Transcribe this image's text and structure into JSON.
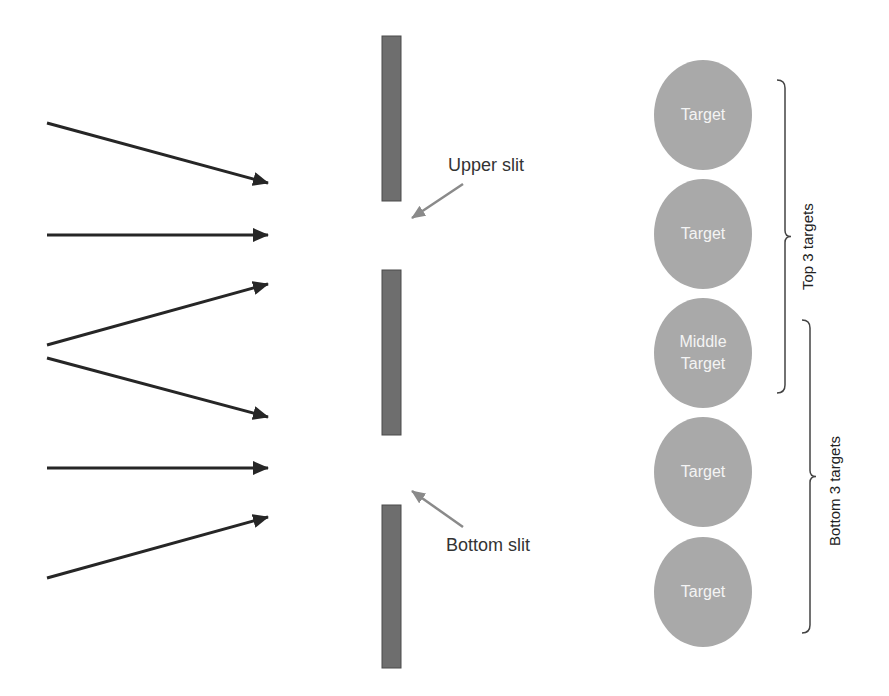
{
  "diagram": {
    "colors": {
      "arrow": "#262626",
      "barrier": "#6e6e6e",
      "pointer": "#8a8a8a",
      "target_fill": "#a9a9a9",
      "target_text": "#f4f4f4",
      "brace": "#444444"
    },
    "incoming_rays": [
      {
        "from": [
          47,
          123
        ],
        "to": [
          268,
          183
        ]
      },
      {
        "from": [
          47,
          235
        ],
        "to": [
          268,
          235
        ]
      },
      {
        "from": [
          47,
          345
        ],
        "to": [
          268,
          284
        ]
      },
      {
        "from": [
          47,
          358
        ],
        "to": [
          268,
          417
        ]
      },
      {
        "from": [
          47,
          468
        ],
        "to": [
          268,
          468
        ]
      },
      {
        "from": [
          47,
          578
        ],
        "to": [
          268,
          517
        ]
      }
    ],
    "barriers": [
      {
        "x": 382,
        "y": 36,
        "w": 19,
        "h": 165
      },
      {
        "x": 382,
        "y": 270,
        "w": 19,
        "h": 165
      },
      {
        "x": 382,
        "y": 505,
        "w": 19,
        "h": 163
      }
    ],
    "slits": [
      {
        "label": "Upper slit",
        "label_pos": [
          448,
          155
        ],
        "pointer_from": [
          463,
          184
        ],
        "pointer_to": [
          412,
          218
        ]
      },
      {
        "label": "Bottom slit",
        "label_pos": [
          446,
          535
        ],
        "pointer_from": [
          463,
          527
        ],
        "pointer_to": [
          412,
          491
        ]
      }
    ],
    "targets": [
      {
        "line1": "Target",
        "line2": "",
        "cx": 703,
        "cy": 115
      },
      {
        "line1": "Target",
        "line2": "",
        "cx": 703,
        "cy": 234
      },
      {
        "line1": "Middle",
        "line2": "Target",
        "cx": 703,
        "cy": 353
      },
      {
        "line1": "Target",
        "line2": "",
        "cx": 703,
        "cy": 472
      },
      {
        "line1": "Target",
        "line2": "",
        "cx": 703,
        "cy": 592
      }
    ],
    "groups": [
      {
        "label": "Top 3 targets",
        "brace_x": 778,
        "y_top": 80,
        "y_bottom": 393
      },
      {
        "label": "Bottom 3 targets",
        "brace_x": 803,
        "y_top": 320,
        "y_bottom": 633
      }
    ]
  }
}
